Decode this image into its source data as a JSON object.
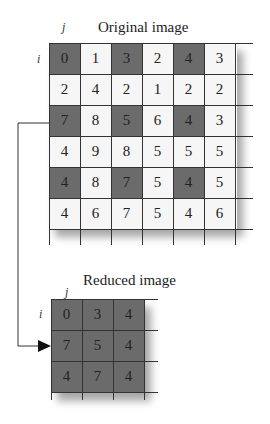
{
  "original": {
    "title": "Original image",
    "axis_j": "j",
    "axis_i": "i",
    "rows": [
      [
        0,
        1,
        3,
        2,
        4,
        3
      ],
      [
        2,
        4,
        2,
        1,
        2,
        2
      ],
      [
        7,
        8,
        5,
        6,
        4,
        3
      ],
      [
        4,
        9,
        8,
        5,
        5,
        5
      ],
      [
        4,
        8,
        7,
        5,
        4,
        5
      ],
      [
        4,
        6,
        7,
        5,
        4,
        6
      ]
    ],
    "shaded": [
      [
        true,
        false,
        true,
        false,
        true,
        false
      ],
      [
        false,
        false,
        false,
        false,
        false,
        false
      ],
      [
        true,
        false,
        true,
        false,
        true,
        false
      ],
      [
        false,
        false,
        false,
        false,
        false,
        false
      ],
      [
        true,
        false,
        true,
        false,
        true,
        false
      ],
      [
        false,
        false,
        false,
        false,
        false,
        false
      ]
    ]
  },
  "reduced": {
    "title": "Reduced image",
    "axis_j": "j",
    "axis_i": "i",
    "rows": [
      [
        0,
        3,
        4
      ],
      [
        7,
        5,
        4
      ],
      [
        4,
        7,
        4
      ]
    ]
  },
  "colors": {
    "shaded": "#6b6b6b",
    "plain": "#f6f6f6",
    "line": "#333333"
  }
}
